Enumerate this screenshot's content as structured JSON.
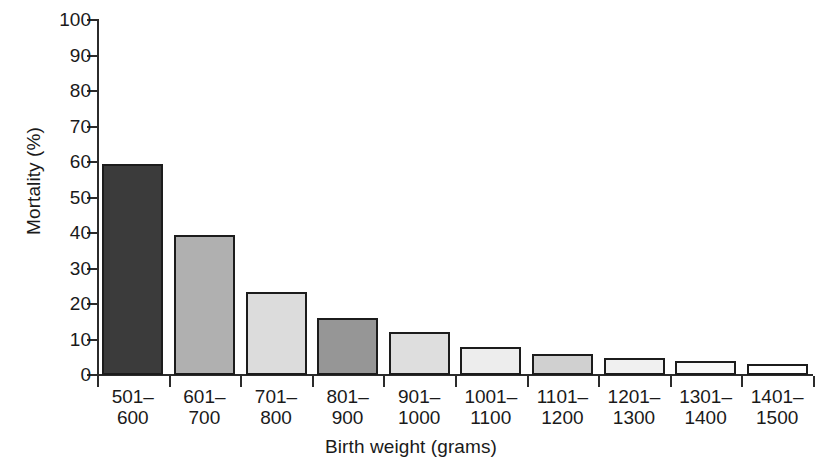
{
  "chart_data": {
    "type": "bar",
    "title": "",
    "xlabel": "Birth weight (grams)",
    "ylabel": "Mortality (%)",
    "ylim": [
      0,
      100
    ],
    "yticks": [
      0,
      10,
      20,
      30,
      40,
      50,
      60,
      70,
      80,
      90,
      100
    ],
    "grid": false,
    "legend": null,
    "categories": [
      "501–600",
      "601–700",
      "701–800",
      "801–900",
      "901–1000",
      "1001–1100",
      "1101–1200",
      "1201–1300",
      "1301–1400",
      "1401–1500"
    ],
    "category_lines": [
      [
        "501–",
        "600"
      ],
      [
        "601–",
        "700"
      ],
      [
        "701–",
        "800"
      ],
      [
        "801–",
        "900"
      ],
      [
        "901–",
        "1000"
      ],
      [
        "1001–",
        "1100"
      ],
      [
        "1101–",
        "1200"
      ],
      [
        "1201–",
        "1300"
      ],
      [
        "1301–",
        "1400"
      ],
      [
        "1401–",
        "1500"
      ]
    ],
    "values": [
      59.5,
      39.5,
      23.5,
      16.2,
      12.0,
      8.0,
      6.0,
      4.8,
      4.0,
      3.2
    ],
    "bar_colors": [
      "#3b3b3b",
      "#b0b0b0",
      "#dcdcdc",
      "#969696",
      "#dedede",
      "#ededed",
      "#d0d0d0",
      "#f0f0f0",
      "#f7f7f7",
      "#ffffff"
    ],
    "bar_edge_color": "#1c1c1c",
    "axis_color": "#2b2b2b",
    "background": "#ffffff"
  }
}
